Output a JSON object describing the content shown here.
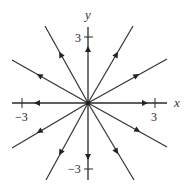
{
  "diagram": {
    "type": "phase-portrait",
    "colors": {
      "line": "#333333",
      "arrow": "#222222",
      "background": "#ffffff"
    },
    "axes": {
      "x_label": "x",
      "y_label": "y",
      "x_ticks": [
        {
          "value": -3,
          "label": "−3"
        },
        {
          "value": 3,
          "label": "3"
        }
      ],
      "y_ticks": [
        {
          "value": 3,
          "label": "3"
        },
        {
          "value": -3,
          "label": "−3"
        }
      ]
    },
    "origin": {
      "label": "origin",
      "type": "unstable-star-node"
    },
    "trajectories": [
      {
        "name": "positive-x-axis",
        "direction": "outward"
      },
      {
        "name": "negative-x-axis",
        "direction": "outward"
      },
      {
        "name": "positive-y-axis",
        "direction": "outward"
      },
      {
        "name": "negative-y-axis",
        "direction": "outward"
      },
      {
        "name": "upper-right-steep",
        "direction": "outward"
      },
      {
        "name": "upper-right-shallow",
        "direction": "outward"
      },
      {
        "name": "upper-left-steep",
        "direction": "outward"
      },
      {
        "name": "upper-left-shallow",
        "direction": "outward"
      },
      {
        "name": "lower-right-steep",
        "direction": "outward"
      },
      {
        "name": "lower-right-shallow",
        "direction": "outward"
      },
      {
        "name": "lower-left-steep",
        "direction": "outward"
      },
      {
        "name": "lower-left-shallow",
        "direction": "outward"
      }
    ]
  }
}
